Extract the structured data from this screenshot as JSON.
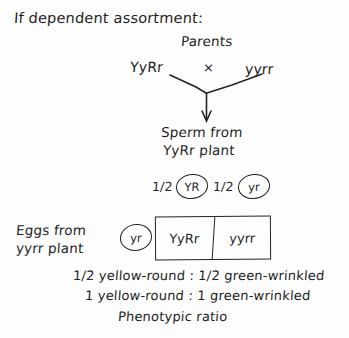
{
  "diagram": {
    "title": "If dependent assortment:",
    "parents": {
      "label": "Parents",
      "left_genotype": "YyRr",
      "cross_symbol": "×",
      "right_genotype": "yyrr"
    },
    "sperm": {
      "label_line1": "Sperm from",
      "label_line2": "YyRr plant",
      "gametes": [
        {
          "fraction": "1/2",
          "allele": "YR"
        },
        {
          "fraction": "1/2",
          "allele": "yr"
        }
      ]
    },
    "eggs": {
      "label_line1": "Eggs from",
      "label_line2": "yyrr plant",
      "gametes": [
        {
          "allele": "yr"
        }
      ]
    },
    "punnett_square": {
      "rows": 1,
      "columns": 2,
      "cells": [
        "YyRr",
        "yyrr"
      ]
    },
    "conclusion": {
      "line1": "1/2 yellow-round : 1/2 green-wrinkled",
      "line2": "1 yellow-round : 1 green-wrinkled",
      "line3": "Phenotypic ratio"
    },
    "colors": {
      "ink": "#1f1f1f",
      "background": "#fdfdfd",
      "rule": "#242424"
    }
  }
}
